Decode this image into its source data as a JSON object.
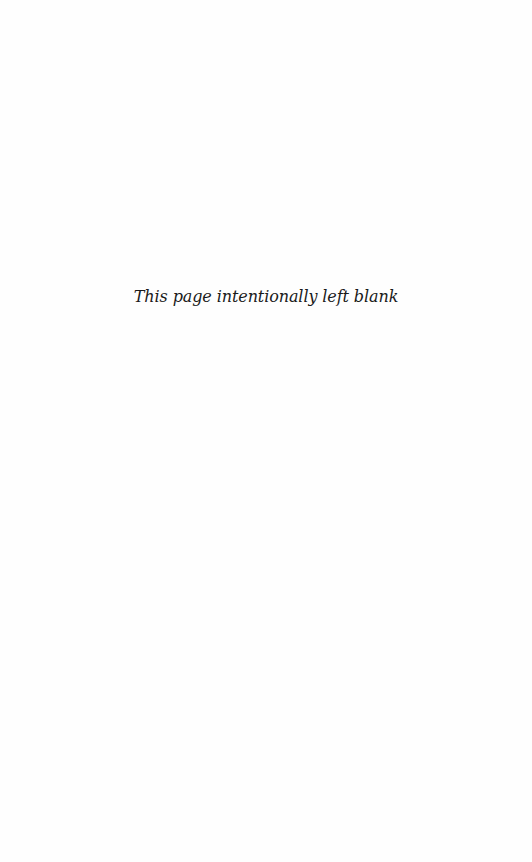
{
  "page": {
    "notice": "This page intentionally left blank",
    "background": "#fefefe",
    "text_color": "#1a1a1a"
  }
}
